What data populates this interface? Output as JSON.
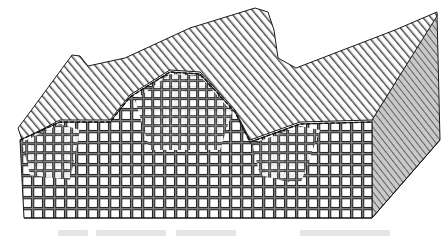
{
  "figure": {
    "colors": {
      "background": "#ffffff",
      "stroke": "#1a1a1a",
      "cube_face": "#ffffff",
      "cube_shadow": "#9a9a9a",
      "side_face": "#bdbdbd"
    },
    "top_surface_profile": [
      {
        "x": 30,
        "y": 110
      },
      {
        "x": 72,
        "y": 55
      },
      {
        "x": 88,
        "y": 65
      },
      {
        "x": 125,
        "y": 58
      },
      {
        "x": 190,
        "y": 28
      },
      {
        "x": 255,
        "y": 8
      },
      {
        "x": 272,
        "y": 18
      },
      {
        "x": 280,
        "y": 60
      },
      {
        "x": 300,
        "y": 68
      },
      {
        "x": 395,
        "y": 30
      },
      {
        "x": 437,
        "y": 10
      }
    ]
  },
  "caption": {
    "text": "",
    "note": "caption cut off at bottom edge; not legible"
  }
}
